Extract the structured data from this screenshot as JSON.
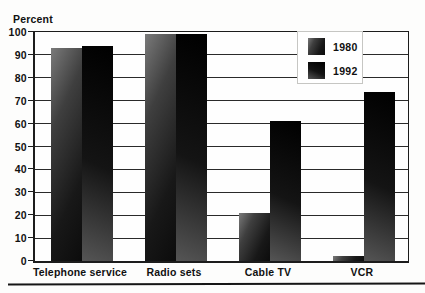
{
  "title": "Percent",
  "chart_data": {
    "type": "bar",
    "title": "Percent",
    "ylabel": "Percent",
    "xlabel": "",
    "categories": [
      "Telephone service",
      "Radio sets",
      "Cable TV",
      "VCR"
    ],
    "series": [
      {
        "name": "1980",
        "values": [
          93,
          99,
          21,
          2
        ]
      },
      {
        "name": "1992",
        "values": [
          94,
          99,
          61,
          74
        ]
      }
    ],
    "ylim": [
      0,
      100
    ],
    "ytick_step": 10,
    "yticks": [
      0,
      10,
      20,
      30,
      40,
      50,
      60,
      70,
      80,
      90,
      100
    ],
    "grid": true,
    "legend_position": "top-right",
    "legend_entries": [
      "1980",
      "1992"
    ],
    "colors": {
      "series_1980": "#3c3c3c",
      "series_1992": "#070707",
      "text": "#111111",
      "gridline": "#2a2a2a",
      "plot_border": "#1c1c1c",
      "background": "#fdfdfc",
      "legend_background": "#ffffff"
    }
  }
}
